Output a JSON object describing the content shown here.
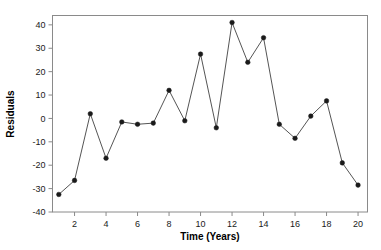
{
  "chart_data": {
    "type": "line",
    "title": "",
    "subtitle": "",
    "xlabel": "Time (Years)",
    "ylabel": "Residuals",
    "x": [
      1,
      2,
      3,
      4,
      5,
      6,
      7,
      8,
      9,
      10,
      11,
      12,
      13,
      14,
      15,
      16,
      17,
      18,
      19,
      20
    ],
    "values": [
      -32.5,
      -26.5,
      2,
      -17,
      -1.5,
      -2.5,
      -2,
      12,
      -1,
      27.5,
      -4,
      41,
      24,
      34.5,
      -2.5,
      -8.5,
      1,
      7.5,
      -19,
      -28.5
    ],
    "series": [
      {
        "name": "Residuals",
        "values": [
          -32.5,
          -26.5,
          2,
          -17,
          -1.5,
          -2.5,
          -2,
          12,
          -1,
          27.5,
          -4,
          41,
          24,
          34.5,
          -2.5,
          -8.5,
          1,
          7.5,
          -19,
          -28.5
        ]
      }
    ],
    "xlim": [
      0.6,
      20.6
    ],
    "ylim": [
      -40,
      44
    ],
    "xticks": [
      2,
      4,
      6,
      8,
      10,
      12,
      14,
      16,
      18,
      20
    ],
    "xtick_labels": [
      "2",
      "4",
      "6",
      "8",
      "10",
      "12",
      "14",
      "16",
      "18",
      "20"
    ],
    "yticks": [
      -40,
      -30,
      -20,
      -10,
      0,
      10,
      20,
      30,
      40
    ],
    "ytick_labels": [
      "-40",
      "-30",
      "-20",
      "-10",
      "0",
      "10",
      "20",
      "30",
      "40"
    ],
    "grid": false,
    "legend": false,
    "legend_position": "none",
    "marker": "filled-circle",
    "line_color": "#555555",
    "marker_color": "#1a1a1a",
    "axis_color": "#8a8a8a",
    "background_color": "#ffffff"
  }
}
